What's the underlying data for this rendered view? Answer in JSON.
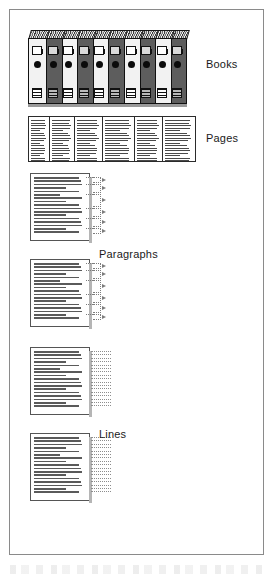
{
  "figure": {
    "frame_color": "#8a8a8a",
    "background": "#ffffff"
  },
  "labels": {
    "books": "Books",
    "pages": "Pages",
    "paragraphs": "Paragraphs",
    "lines": "Lines"
  },
  "chart_data": {
    "type": "diagram",
    "levels": [
      "Books",
      "Pages",
      "Paragraphs",
      "Lines"
    ],
    "books": {
      "count": 10,
      "shades": [
        "light",
        "dark",
        "light",
        "dark",
        "light",
        "dark",
        "light",
        "dark",
        "light",
        "dark"
      ],
      "light_color": "#f2f2f2",
      "dark_color": "#5d5d5d",
      "features": [
        "spine-window",
        "ring-hole-dot",
        "spine-tag"
      ]
    },
    "pages": {
      "count": 6,
      "widths": [
        22,
        26,
        29,
        33,
        29,
        34
      ],
      "line_counts": [
        17,
        17,
        17,
        17,
        17,
        17
      ]
    },
    "paragraphs": {
      "page_count": 2,
      "lines_per_page": 17,
      "group_sizes": [
        2,
        3,
        4,
        3,
        3,
        2
      ],
      "marker": "dotted-brace"
    },
    "lines": {
      "page_count": 2,
      "lines_per_page": 17,
      "marker": "dotted-row"
    }
  }
}
